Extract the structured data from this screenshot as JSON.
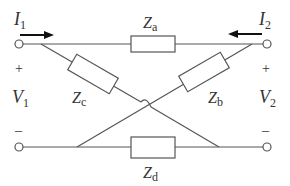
{
  "diagram": {
    "type": "lattice two-port network",
    "currents": {
      "left": {
        "symbol": "I",
        "sub": "1"
      },
      "right": {
        "symbol": "I",
        "sub": "2"
      }
    },
    "voltages": {
      "left": {
        "symbol": "V",
        "sub": "1"
      },
      "right": {
        "symbol": "V",
        "sub": "2"
      }
    },
    "polarity": {
      "plus": "+",
      "minus": "–"
    },
    "impedances": {
      "a": {
        "symbol": "Z",
        "sub": "a"
      },
      "b": {
        "symbol": "Z",
        "sub": "b"
      },
      "c": {
        "symbol": "Z",
        "sub": "c"
      },
      "d": {
        "symbol": "Z",
        "sub": "d"
      }
    },
    "colors": {
      "line": "#555555",
      "arrow": "#111111",
      "text": "#333333"
    }
  }
}
